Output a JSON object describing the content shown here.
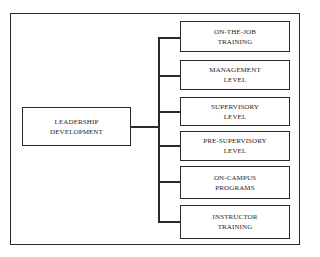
{
  "diagram": {
    "root": {
      "line1": "LEADERSHIP",
      "line2": "DEVELOPMENT"
    },
    "children": [
      {
        "line1": "ON-THE-JOB",
        "line2": "TRAINING"
      },
      {
        "line1": "MANAGEMENT",
        "line2": "LEVEL"
      },
      {
        "line1": "SUPERVISORY",
        "line2": "LEVEL"
      },
      {
        "line1": "PRE-SUPERVISORY",
        "line2": "LEVEL"
      },
      {
        "line1": "ON-CAMPUS",
        "line2": "PROGRAMS"
      },
      {
        "line1": "INSTRUCTOR",
        "line2": "TRAINING"
      }
    ]
  }
}
